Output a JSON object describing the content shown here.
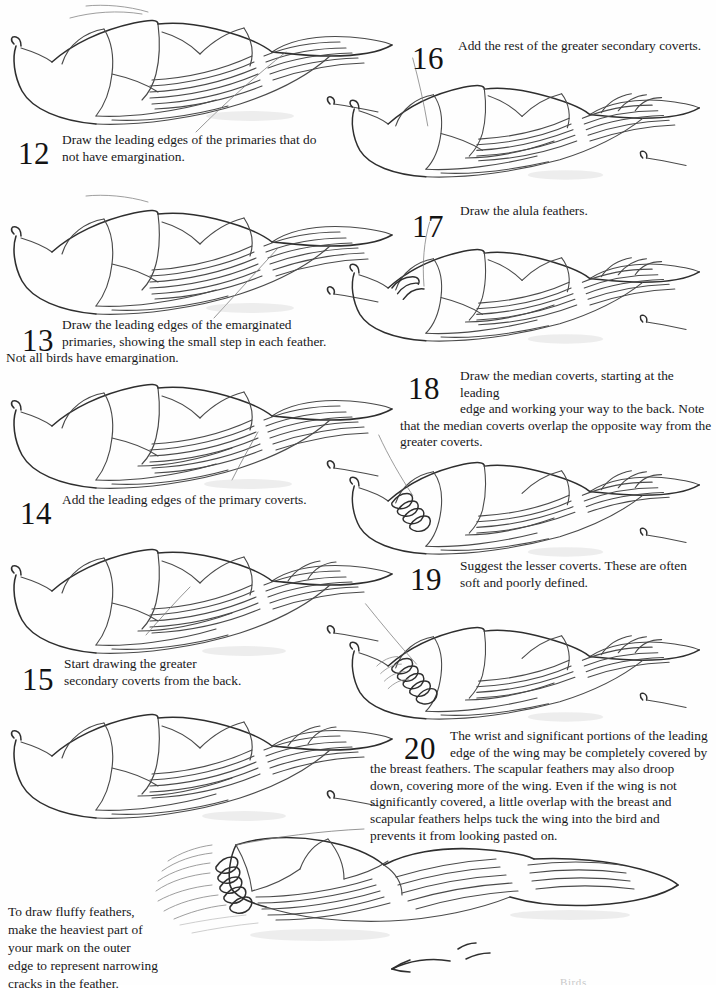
{
  "document": {
    "kind": "instructional-drawing-page",
    "subject": "How to draw a bird wing — steps 12 through 20",
    "background_color": "#fefefe",
    "ink_color": "#4a4a4a",
    "text_color": "#18181a"
  },
  "steps": [
    {
      "number": "12",
      "text": "Draw the leading edges of the primaries that do\nnot have emargination."
    },
    {
      "number": "13",
      "text": "Draw the leading edges of the emarginated\nprimaries, showing the small step in each feather."
    },
    {
      "number": "14",
      "text": "Add the leading edges of the primary coverts."
    },
    {
      "number": "15",
      "text": "Start drawing the greater\nsecondary coverts from the back."
    },
    {
      "number": "16",
      "text": "Add the rest of the greater secondary coverts."
    },
    {
      "number": "17",
      "text": "Draw the alula feathers."
    },
    {
      "number": "18",
      "text": "Draw the median coverts, starting at the leading\nedge and working your way to the back. Note"
    },
    {
      "number": "19",
      "text": "Suggest the lesser coverts. These are often\nsoft and poorly defined."
    },
    {
      "number": "20",
      "text": "The wrist and significant portions of the leading\nedge of the wing may be completely covered by"
    }
  ],
  "overflow": {
    "step13_tail": "Not all birds have emargination.",
    "step18_tail": "that the median coverts overlap the opposite way from the\ngreater coverts.",
    "step20_tail": "the breast feathers. The scapular feathers may also droop\ndown, covering more of the wing. Even if the wing is not\nsignificantly covered, a little overlap with the breast and\nscapular feathers helps tuck the wing into the bird and\nprevents it from looking pasted on."
  },
  "caption": {
    "text": "To draw fluffy feathers,\nmake the heaviest part of\nyour mark on the outer\nedge to represent narrowing\ncracks in the feather."
  },
  "footer": {
    "text": "Birds"
  }
}
